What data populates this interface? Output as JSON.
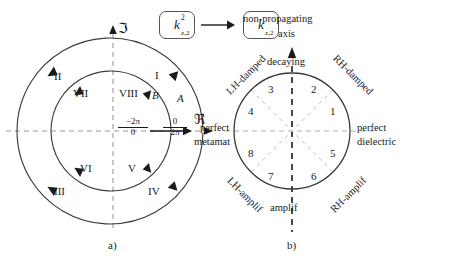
{
  "figure": {
    "top_symbols": {
      "left_box": {
        "base": "k",
        "superscript": "2",
        "subscript": "z,2"
      },
      "right_box": {
        "base": "k",
        "superscript": "",
        "subscript": "z,2"
      },
      "arrow": "→"
    },
    "panel_a": {
      "caption": "a)",
      "axis_imaginary": "ℑ",
      "axis_real": "ℜ",
      "outer_circle_label": "A",
      "inner_circle_label": "B",
      "outer_quadrants": [
        "I",
        "II",
        "III",
        "IV"
      ],
      "inner_quadrants": [
        "V",
        "VI",
        "VII",
        "VIII"
      ],
      "left_branch_numerator": "−2π",
      "left_branch_denominator": "0",
      "right_branch_numerator": "0",
      "right_branch_denominator": "2π"
    },
    "panel_b": {
      "caption": "b)",
      "axis_title_line1": "non-propagating",
      "axis_title_line2": "axis",
      "sector_numbers": [
        "1",
        "2",
        "3",
        "4",
        "5",
        "6",
        "7",
        "8"
      ],
      "label_top": "decaying",
      "label_bottom": "amplif",
      "label_right_line1": "perfect",
      "label_right_line2": "dielectric",
      "label_left_line1": "perfect",
      "label_left_line2": "metamat",
      "label_upper_left": "LH-damped",
      "label_upper_right": "RH-damped",
      "label_lower_left": "LH-amplif",
      "label_lower_right": "RH-amplif"
    }
  },
  "colors": {
    "ink": "#1a1a1a",
    "curve": "#3a3a3a",
    "dashed_axis": "#9a9a9a",
    "dashed_sector": "#c4c4c4",
    "box_border": "#555555",
    "background": "#ffffff"
  }
}
